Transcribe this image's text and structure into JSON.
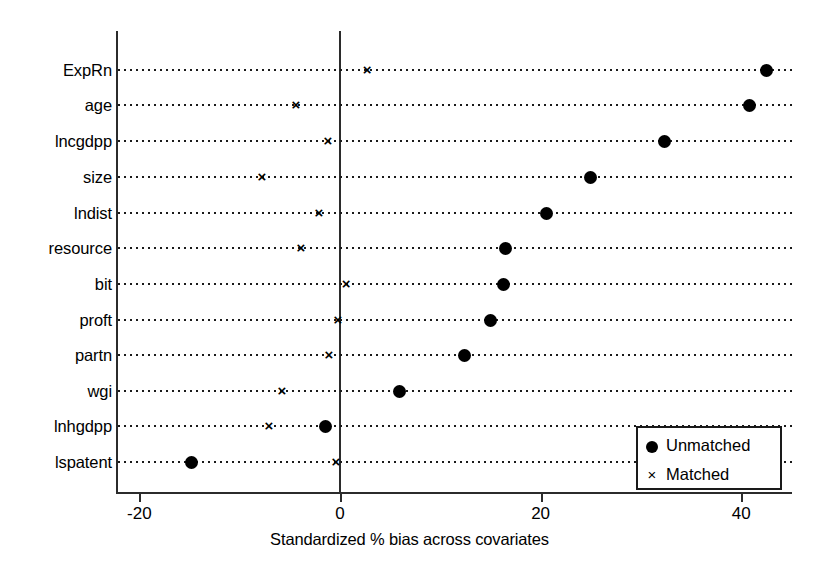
{
  "chart_data": {
    "type": "scatter",
    "title": "",
    "xlabel": "Standardized % bias across covariates",
    "ylabel": "",
    "xlim": [
      -25,
      45
    ],
    "xticks": [
      -20,
      0,
      20,
      40
    ],
    "xticklabels": [
      "-20",
      "0",
      "20",
      "40"
    ],
    "grid": "dotted-horizontal",
    "legend_position": "lower-right",
    "zero_reference_line": 0,
    "categories": [
      "ExpRn",
      "age",
      "lncgdpp",
      "size",
      "lndist",
      "resource",
      "bit",
      "proft",
      "partn",
      "wgi",
      "lnhgdpp",
      "lspatent"
    ],
    "series": [
      {
        "name": "Unmatched",
        "marker": "filled-circle",
        "values": [
          42.5,
          40.8,
          32.4,
          25.0,
          20.6,
          16.5,
          16.3,
          15.0,
          12.4,
          5.9,
          -1.4,
          -14.8
        ]
      },
      {
        "name": "Matched",
        "marker": "x",
        "values": [
          2.7,
          -4.4,
          -1.2,
          -7.8,
          -2.1,
          -3.9,
          0.6,
          -0.2,
          -1.1,
          -5.8,
          -7.1,
          -0.4
        ]
      }
    ]
  },
  "legend": {
    "entries": [
      {
        "label": "Unmatched",
        "marker": "filled-circle-icon"
      },
      {
        "label": "Matched",
        "marker": "x-marker-icon"
      }
    ]
  }
}
